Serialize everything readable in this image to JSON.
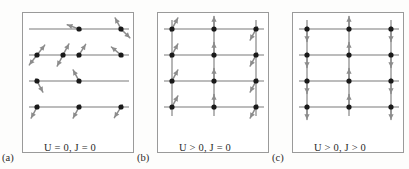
{
  "figure": {
    "background_color": "#fdfdfc",
    "box_border_color": "#9a9a9a",
    "bond_line_color": "#7a7a7a",
    "site_dot_color": "#1a1a1a",
    "arrow_color": "#8c8c8c",
    "text_color": "#2a2a2a"
  },
  "panels": [
    {
      "id": "a",
      "sub_label": "(a)",
      "caption": "U = 0, J = 0",
      "caption_parts": {
        "u_symbol": "U",
        "u_relation": "= 0",
        "j_symbol": "J",
        "j_relation": "= 0"
      },
      "description": "disordered lattice with empty, singly and doubly occupied sites and randomly tilted spins",
      "grid": {
        "columns": 3,
        "rows": 4
      },
      "vertical_bonds": false,
      "sites": [
        {
          "row": 0,
          "col": 0,
          "electrons": []
        },
        {
          "row": 0,
          "col": 1,
          "electrons": [
            {
              "angle": 160
            }
          ]
        },
        {
          "row": 0,
          "col": 2,
          "electrons": [
            {
              "angle": 118
            },
            {
              "angle": -45
            }
          ]
        },
        {
          "row": 1,
          "col": 0,
          "electrons": [
            {
              "angle": 52
            },
            {
              "angle": -128
            }
          ]
        },
        {
          "row": 1,
          "col": 0.62,
          "electrons": [
            {
              "angle": 62
            },
            {
              "angle": -118
            }
          ]
        },
        {
          "row": 1,
          "col": 1,
          "electrons": [
            {
              "angle": 58
            }
          ]
        },
        {
          "row": 1,
          "col": 2,
          "electrons": [
            {
              "angle": 140
            }
          ]
        },
        {
          "row": 2,
          "col": 0,
          "electrons": [
            {
              "angle": -62
            }
          ]
        },
        {
          "row": 2,
          "col": 1,
          "electrons": [
            {
              "angle": 118
            }
          ]
        },
        {
          "row": 2,
          "col": 2,
          "electrons": []
        },
        {
          "row": 3,
          "col": 0,
          "electrons": [
            {
              "angle": -118
            }
          ]
        },
        {
          "row": 3,
          "col": 1,
          "electrons": [
            {
              "angle": -118
            }
          ]
        },
        {
          "row": 3,
          "col": 2,
          "electrons": [
            {
              "angle": -122
            }
          ]
        },
        {
          "row": 3,
          "col": 2.58,
          "electrons": [
            {
              "angle": 58
            }
          ]
        }
      ]
    },
    {
      "id": "b",
      "sub_label": "(b)",
      "caption": "U > 0, J = 0",
      "caption_parts": {
        "u_symbol": "U",
        "u_relation": "> 0",
        "j_symbol": "J",
        "j_relation": "= 0"
      },
      "description": "singly occupied lattice with one electron per site and uncorrelated tilted spin directions",
      "grid": {
        "columns": 3,
        "rows": 4
      },
      "vertical_bonds": true,
      "sites": [
        {
          "row": 0,
          "col": 0,
          "electrons": [
            {
              "angle": 62
            }
          ]
        },
        {
          "row": 0,
          "col": 1,
          "electrons": [
            {
              "angle": 90
            }
          ]
        },
        {
          "row": 0,
          "col": 2,
          "electrons": [
            {
              "angle": -118
            }
          ]
        },
        {
          "row": 1,
          "col": 0,
          "electrons": [
            {
              "angle": 62
            }
          ]
        },
        {
          "row": 1,
          "col": 1,
          "electrons": [
            {
              "angle": 90
            }
          ]
        },
        {
          "row": 1,
          "col": 2,
          "electrons": [
            {
              "angle": -118
            }
          ]
        },
        {
          "row": 2,
          "col": 0,
          "electrons": [
            {
              "angle": 62
            }
          ]
        },
        {
          "row": 2,
          "col": 1,
          "electrons": [
            {
              "angle": 90
            }
          ]
        },
        {
          "row": 2,
          "col": 2,
          "electrons": [
            {
              "angle": -118
            }
          ]
        },
        {
          "row": 3,
          "col": 0,
          "electrons": [
            {
              "angle": 62
            }
          ]
        },
        {
          "row": 3,
          "col": 1,
          "electrons": [
            {
              "angle": 90
            }
          ]
        },
        {
          "row": 3,
          "col": 2,
          "electrons": [
            {
              "angle": -118
            }
          ]
        }
      ]
    },
    {
      "id": "c",
      "sub_label": "(c)",
      "caption": "U > 0, J > 0",
      "caption_parts": {
        "u_symbol": "U",
        "u_relation": "> 0",
        "j_symbol": "J",
        "j_relation": "> 0"
      },
      "description": "antiferromagnetically ordered lattice with alternating up and down vertical spins",
      "grid": {
        "columns": 3,
        "rows": 4
      },
      "vertical_bonds": true,
      "sites": [
        {
          "row": 0,
          "col": 0,
          "electrons": [
            {
              "angle": -90
            }
          ]
        },
        {
          "row": 0,
          "col": 1,
          "electrons": [
            {
              "angle": 90
            }
          ]
        },
        {
          "row": 0,
          "col": 2,
          "electrons": [
            {
              "angle": -90
            }
          ]
        },
        {
          "row": 1,
          "col": 0,
          "electrons": [
            {
              "angle": -90
            }
          ]
        },
        {
          "row": 1,
          "col": 1,
          "electrons": [
            {
              "angle": 90
            }
          ]
        },
        {
          "row": 1,
          "col": 2,
          "electrons": [
            {
              "angle": -90
            }
          ]
        },
        {
          "row": 2,
          "col": 0,
          "electrons": [
            {
              "angle": -90
            }
          ]
        },
        {
          "row": 2,
          "col": 1,
          "electrons": [
            {
              "angle": 90
            }
          ]
        },
        {
          "row": 2,
          "col": 2,
          "electrons": [
            {
              "angle": -90
            }
          ]
        },
        {
          "row": 3,
          "col": 0,
          "electrons": [
            {
              "angle": -90
            }
          ]
        },
        {
          "row": 3,
          "col": 1,
          "electrons": [
            {
              "angle": 90
            }
          ]
        },
        {
          "row": 3,
          "col": 2,
          "electrons": [
            {
              "angle": -90
            }
          ]
        }
      ]
    }
  ]
}
